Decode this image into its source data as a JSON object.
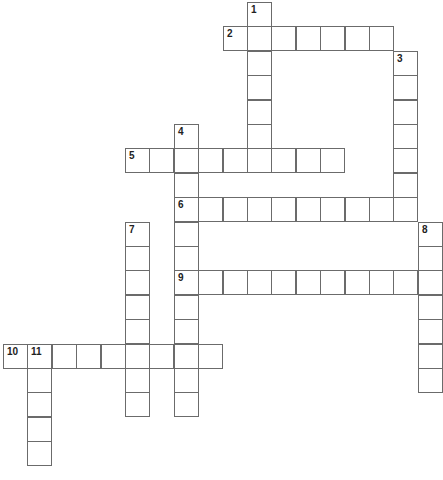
{
  "puzzle": {
    "grid": {
      "origin_x": 3,
      "origin_y": 2,
      "pitch": 24.4,
      "cols": 18,
      "rows": 19,
      "border_color": "#6b6b6b",
      "cell_fill": "#ffffff"
    },
    "words": [
      {
        "number": "1",
        "direction": "down",
        "col": 10,
        "row": 0,
        "length": 7
      },
      {
        "number": "2",
        "direction": "across",
        "col": 9,
        "row": 1,
        "length": 7
      },
      {
        "number": "3",
        "direction": "down",
        "col": 16,
        "row": 2,
        "length": 7
      },
      {
        "number": "4",
        "direction": "down",
        "col": 7,
        "row": 5,
        "length": 12
      },
      {
        "number": "5",
        "direction": "across",
        "col": 5,
        "row": 6,
        "length": 9
      },
      {
        "number": "6",
        "direction": "across",
        "col": 7,
        "row": 8,
        "length": 10
      },
      {
        "number": "7",
        "direction": "down",
        "col": 5,
        "row": 9,
        "length": 8
      },
      {
        "number": "8",
        "direction": "down",
        "col": 17,
        "row": 9,
        "length": 7
      },
      {
        "number": "9",
        "direction": "across",
        "col": 7,
        "row": 11,
        "length": 11
      },
      {
        "number": "10",
        "direction": "across",
        "col": 0,
        "row": 14,
        "length": 9
      },
      {
        "number": "11",
        "direction": "down",
        "col": 1,
        "row": 14,
        "length": 5
      }
    ]
  }
}
